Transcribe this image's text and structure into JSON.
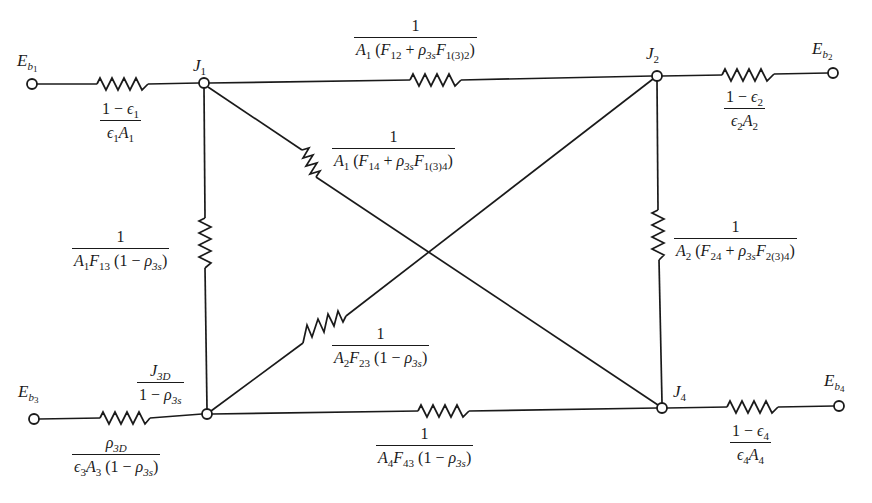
{
  "diagram": {
    "type": "radiation-network",
    "stroke_color": "#1a1a1a",
    "background": "#ffffff"
  },
  "terminals": [
    {
      "id": "Eb1",
      "symbol": "E",
      "sub": "b",
      "subsub": "1",
      "x": 32,
      "y": 84
    },
    {
      "id": "Eb2",
      "symbol": "E",
      "sub": "b",
      "subsub": "2",
      "x": 833,
      "y": 73
    },
    {
      "id": "Eb3",
      "symbol": "E",
      "sub": "b",
      "subsub": "3",
      "x": 34,
      "y": 419
    },
    {
      "id": "Eb4",
      "symbol": "E",
      "sub": "b",
      "subsub": "4",
      "x": 839,
      "y": 406
    }
  ],
  "nodes": [
    {
      "id": "J1",
      "symbol": "J",
      "sub": "1",
      "x": 204,
      "y": 83
    },
    {
      "id": "J2",
      "symbol": "J",
      "sub": "2",
      "x": 657,
      "y": 76
    },
    {
      "id": "J3",
      "symbol": "",
      "sub": "",
      "x": 207,
      "y": 414
    },
    {
      "id": "J4",
      "symbol": "J",
      "sub": "4",
      "x": 662,
      "y": 408
    }
  ],
  "labels": {
    "eb1": {
      "main": "E",
      "sub": "b",
      "subsub": "1"
    },
    "eb2": {
      "main": "E",
      "sub": "b",
      "subsub": "2"
    },
    "eb3": {
      "main": "E",
      "sub": "b",
      "subsub": "3"
    },
    "eb4": {
      "main": "E",
      "sub": "b",
      "subsub": "4"
    },
    "j1": {
      "main": "J",
      "sub": "1"
    },
    "j2": {
      "main": "J",
      "sub": "2"
    },
    "j4": {
      "main": "J",
      "sub": "4"
    }
  },
  "resistances": {
    "surface1": {
      "num": "1 − ϵ₁",
      "den": "ϵ₁A₁",
      "num_parts": [
        "1 − ",
        "ϵ",
        "1"
      ],
      "den_parts": [
        "ϵ",
        "1",
        "A",
        "1"
      ]
    },
    "surface2": {
      "num_parts": [
        "1 − ",
        "ϵ",
        "2"
      ],
      "den_parts": [
        "ϵ",
        "2",
        "A",
        "2"
      ]
    },
    "surface4": {
      "num_parts": [
        "1 − ",
        "ϵ",
        "4"
      ],
      "den_parts": [
        "ϵ",
        "4",
        "A",
        "4"
      ]
    },
    "surface3": {
      "num_parts": [
        "ρ",
        "3D"
      ],
      "den_parts": [
        "ϵ",
        "3",
        "A",
        "3",
        " (1 − ",
        "ρ",
        "3s",
        ")"
      ]
    },
    "j3_node": {
      "num_parts": [
        "J",
        "3D"
      ],
      "den_parts": [
        "1 − ",
        "ρ",
        "3s"
      ]
    },
    "r12": {
      "num": "1",
      "den_parts": [
        "A",
        "1",
        " (",
        "F",
        "12",
        " + ",
        "ρ",
        "3s",
        "F",
        "1(3)2",
        ")"
      ]
    },
    "r14": {
      "num": "1",
      "den_parts": [
        "A",
        "1",
        " (",
        "F",
        "14",
        " + ",
        "ρ",
        "3s",
        "F",
        "1(3)4",
        ")"
      ]
    },
    "r13": {
      "num": "1",
      "den_parts": [
        "A",
        "1",
        "F",
        "13",
        " (1 − ",
        "ρ",
        "3s",
        ")"
      ]
    },
    "r24": {
      "num": "1",
      "den_parts": [
        "A",
        "2",
        " (",
        "F",
        "24",
        " + ",
        "ρ",
        "3s",
        "F",
        "2(3)4",
        ")"
      ]
    },
    "r23": {
      "num": "1",
      "den_parts": [
        "A",
        "2",
        "F",
        "23",
        " (1 − ",
        "ρ",
        "3s",
        ")"
      ]
    },
    "r43": {
      "num": "1",
      "den_parts": [
        "A",
        "4",
        "F",
        "43",
        " (1 − ",
        "ρ",
        "3s",
        ")"
      ]
    }
  }
}
